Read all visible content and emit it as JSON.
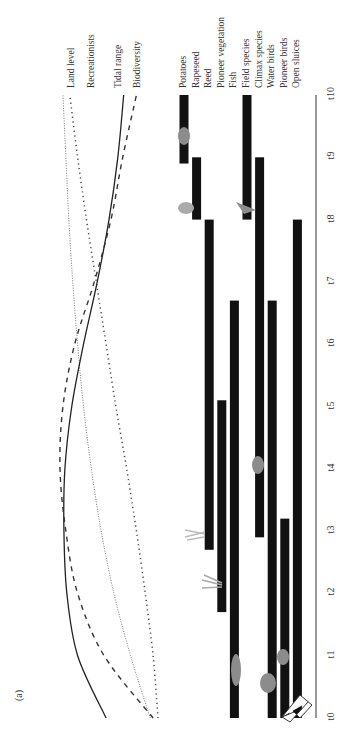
{
  "panel_label": "(a)",
  "chart_data": {
    "type": "gantt+line",
    "orientation": "rotated-90-ccw",
    "panel": "(a)",
    "time_axis": {
      "ticks": [
        "t0",
        "t1",
        "t2",
        "t3",
        "t4",
        "t5",
        "t6",
        "t7",
        "t8",
        "t9",
        "t10"
      ],
      "range": [
        0,
        10
      ]
    },
    "curves": [
      {
        "name": "Land level",
        "style": "dotted-fine",
        "values": [
          0.08,
          0.28,
          0.45,
          0.58,
          0.68,
          0.76,
          0.82,
          0.87,
          0.91,
          0.94,
          0.97
        ]
      },
      {
        "name": "Recreationists",
        "style": "dotted-coarse",
        "values": [
          0.0,
          0.05,
          0.13,
          0.22,
          0.32,
          0.43,
          0.53,
          0.63,
          0.73,
          0.82,
          0.9
        ]
      },
      {
        "name": "Tidal range",
        "style": "solid",
        "values": [
          0.53,
          0.82,
          0.93,
          0.96,
          0.95,
          0.88,
          0.76,
          0.62,
          0.5,
          0.41,
          0.35
        ]
      },
      {
        "name": "Biodiversity",
        "style": "dashed",
        "values": [
          0.05,
          0.55,
          0.82,
          0.94,
          1.0,
          0.97,
          0.85,
          0.65,
          0.48,
          0.36,
          0.22
        ]
      }
    ],
    "bars": [
      {
        "name": "Potatoes",
        "start": 8.9,
        "end": 10.0,
        "icon": "potato"
      },
      {
        "name": "Rapeseed",
        "start": 8.0,
        "end": 9.0,
        "icon": "rapeseed"
      },
      {
        "name": "Reed",
        "start": 2.7,
        "end": 8.0,
        "icon": "reed"
      },
      {
        "name": "Pioneer vegetation",
        "start": 1.7,
        "end": 5.1,
        "icon": "grass"
      },
      {
        "name": "Fish",
        "start": 0.0,
        "end": 6.7,
        "icon": "fish"
      },
      {
        "name": "Field species",
        "start": 8.0,
        "end": 10.0,
        "icon": "bird"
      },
      {
        "name": "Climax species",
        "start": 2.9,
        "end": 9.0,
        "icon": "deer"
      },
      {
        "name": "Water birds",
        "start": 0.0,
        "end": 6.7,
        "icon": "duck"
      },
      {
        "name": "Pioneer birds",
        "start": 0.0,
        "end": 3.2,
        "icon": "wader"
      },
      {
        "name": "Open sluices",
        "start": 0.0,
        "end": 8.0,
        "icon": "sluice"
      }
    ],
    "grid": false,
    "legend_position": "top (curve labels at end of lines)"
  }
}
